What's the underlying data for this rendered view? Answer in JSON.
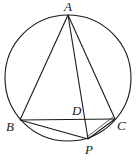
{
  "diagram": {
    "type": "geometry",
    "circle": {
      "cx": 68,
      "cy": 78,
      "r": 63
    },
    "points": {
      "A": {
        "label": "A",
        "x": 68,
        "y": 15,
        "lx": 64,
        "ly": 11
      },
      "B": {
        "label": "B",
        "x": 20,
        "y": 120,
        "lx": 6,
        "ly": 131
      },
      "C": {
        "label": "C",
        "x": 115,
        "y": 119,
        "lx": 117,
        "ly": 130
      },
      "D": {
        "label": "D",
        "x": 85,
        "y": 119,
        "lx": 72,
        "ly": 115
      },
      "P": {
        "label": "P",
        "x": 88,
        "y": 139,
        "lx": 85,
        "ly": 154
      }
    },
    "segments": [
      "AB",
      "AC",
      "AP",
      "BC",
      "BP",
      "CP"
    ]
  }
}
